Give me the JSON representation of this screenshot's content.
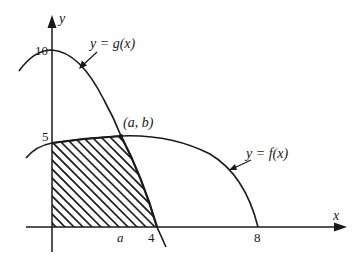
{
  "figure": {
    "axes": {
      "x_label": "x",
      "y_label": "y",
      "x_ticks": [
        {
          "label": "a",
          "italic": true
        },
        {
          "label": "4",
          "italic": false
        },
        {
          "label": "8",
          "italic": false
        }
      ],
      "y_ticks": [
        {
          "label": "5"
        },
        {
          "label": "10"
        }
      ]
    },
    "curves": [
      {
        "name": "g",
        "label": "y = g(x)",
        "y_intercept": 10,
        "x_intercept": 4
      },
      {
        "name": "f",
        "label": "y = f(x)",
        "y_intercept": 5,
        "x_intercept": 8
      }
    ],
    "intersection": {
      "label": "(a, b)"
    },
    "shaded_region": {
      "description": "Region bounded by y-axis, x-axis, y=f(x) from 0 to a, and y=g(x) from a to 4",
      "pattern": "diagonal hatch"
    },
    "colors": {
      "ink": "#1a1a1a",
      "background": "#ffffff"
    }
  }
}
